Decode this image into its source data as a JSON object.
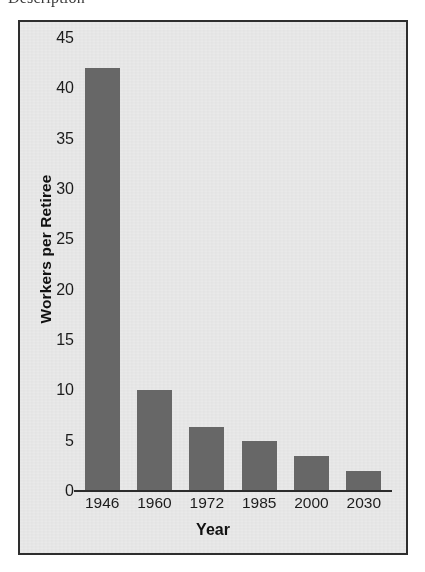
{
  "caption": {
    "clipped_text": "Description"
  },
  "chart_data": {
    "type": "bar",
    "title": "",
    "subtitle": "",
    "xlabel": "Year",
    "ylabel": "Workers per Retiree",
    "categories": [
      "1946",
      "1960",
      "1972",
      "1985",
      "2000",
      "2030"
    ],
    "values": [
      42,
      10,
      6.4,
      5,
      3.5,
      2
    ],
    "ylim": [
      0,
      45
    ],
    "yticks": [
      0,
      5,
      10,
      15,
      20,
      25,
      30,
      35,
      40,
      45
    ],
    "ytick_labels": [
      "0",
      "5",
      "10",
      "15",
      "20",
      "25",
      "30",
      "35",
      "40",
      "45"
    ],
    "grid": false,
    "legend": false,
    "legend_position": "none",
    "bar_color": "#676767",
    "plot_background": "#e9e9e9",
    "frame_color": "#2e2e2e",
    "axis_color": "#2b2b2b",
    "text_color": "#1c1c1c"
  }
}
